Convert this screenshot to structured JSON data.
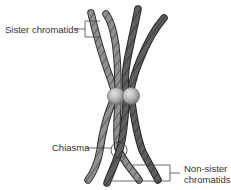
{
  "diagram": {
    "type": "biology-illustration",
    "labels": {
      "sister_chromatids": "Sister chromatids",
      "chiasma": "Chiasma",
      "non_sister_line1": "Non-sister",
      "non_sister_line2": "chromatids"
    },
    "colors": {
      "light_chromatid": "#8f8f8f",
      "dark_chromatid": "#5a5a5a",
      "outline": "#2e2e2e",
      "centromere": "#b5b5b5",
      "leader_line": "#444444"
    }
  }
}
